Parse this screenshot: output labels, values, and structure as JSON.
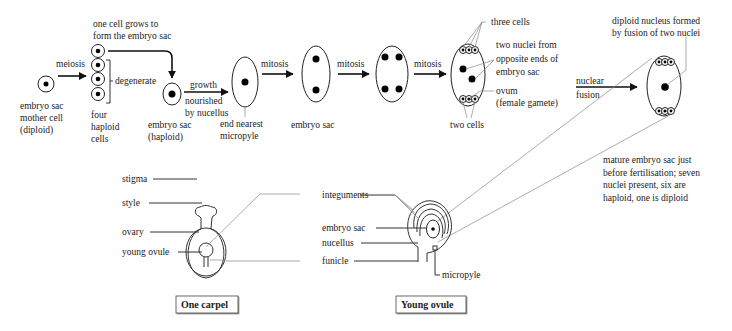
{
  "top_sequence": {
    "mother_cell_label": [
      "embryo sac",
      "mother cell",
      "(diploid)"
    ],
    "meiosis_label": "meiosis",
    "grow_label": [
      "one cell grows to",
      "form the embryo sac"
    ],
    "degenerate_label": "degenerate",
    "four_haploid_label": [
      "four",
      "haploid",
      "cells"
    ],
    "growth_label": "growth",
    "nourished_label": [
      "nourished",
      "by nucellus"
    ],
    "embryo_sac_haploid_label": [
      "embryo sac",
      "(haploid)"
    ],
    "end_nearest_label": [
      "end nearest",
      "micropyle"
    ],
    "mitosis_1": "mitosis",
    "mitosis_2": "mitosis",
    "mitosis_3": "mitosis",
    "embryo_sac_label": "embryo sac",
    "three_cells_label": "three cells",
    "two_nuclei_label": [
      "two nuclei from",
      "opposite ends of",
      "embryo sac"
    ],
    "ovum_label": [
      "ovum",
      "(female gamete)"
    ],
    "two_cells_label": "two cells",
    "nuclear_fusion_label": [
      "nuclear",
      "fusion"
    ],
    "diploid_nucleus_label": [
      "diploid nucleus formed",
      "by fusion of two nuclei"
    ],
    "mature_sac_label": [
      "mature embryo sac just",
      "before fertilisation; seven",
      "nuclei present, six are",
      "haploid, one is diploid"
    ]
  },
  "carpel": {
    "labels": {
      "stigma": "stigma",
      "style": "style",
      "ovary": "ovary",
      "young_ovule": "young ovule"
    },
    "caption": "One carpel"
  },
  "ovule": {
    "labels": {
      "integuments": "integuments",
      "embryo_sac": "embryo sac",
      "nucellus": "nucellus",
      "funicle": "funicle",
      "micropyle": "micropyle"
    },
    "caption": "Young ovule"
  }
}
